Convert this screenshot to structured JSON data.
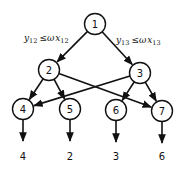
{
  "diagram": {
    "type": "directed-tree-network",
    "nodes": [
      {
        "id": "1",
        "label": "1"
      },
      {
        "id": "2",
        "label": "2"
      },
      {
        "id": "3",
        "label": "3"
      },
      {
        "id": "4",
        "label": "4"
      },
      {
        "id": "5",
        "label": "5"
      },
      {
        "id": "6",
        "label": "6"
      },
      {
        "id": "7",
        "label": "7"
      }
    ],
    "edges": [
      {
        "from": "1",
        "to": "2"
      },
      {
        "from": "1",
        "to": "3"
      },
      {
        "from": "2",
        "to": "4"
      },
      {
        "from": "2",
        "to": "5"
      },
      {
        "from": "2",
        "to": "7"
      },
      {
        "from": "3",
        "to": "4"
      },
      {
        "from": "3",
        "to": "6"
      },
      {
        "from": "3",
        "to": "7"
      }
    ],
    "outputs": [
      {
        "node": "4",
        "value": "4"
      },
      {
        "node": "5",
        "value": "2"
      },
      {
        "node": "6",
        "value": "3"
      },
      {
        "node": "7",
        "value": "6"
      }
    ],
    "constraints": [
      {
        "edge": "1-2",
        "y": "y",
        "y_sub": "12",
        "rel": "≤",
        "w": "ω",
        "x": "x",
        "x_sub": "12"
      },
      {
        "edge": "1-3",
        "y": "y",
        "y_sub": "13",
        "rel": "≤",
        "w": "ω",
        "x": "x",
        "x_sub": "13"
      }
    ]
  }
}
